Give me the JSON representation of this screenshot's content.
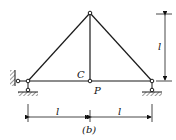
{
  "figure": {
    "caption": "(b)",
    "labels": {
      "node_c": "C",
      "load_p": "P",
      "dim_vertical": "l",
      "dim_left": "l",
      "dim_right": "l"
    },
    "colors": {
      "line": "#1a1a1a",
      "background": "#ffffff"
    }
  }
}
